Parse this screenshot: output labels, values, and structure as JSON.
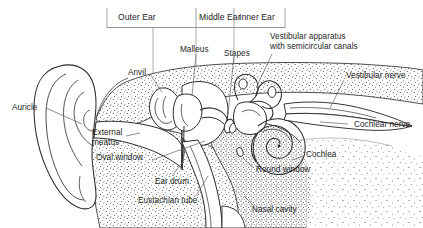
{
  "figure": {
    "type": "labelled-anatomical-diagram",
    "background_color": "#ffffff",
    "ink_color": "#1d1d1d",
    "leader_line_color": "#6e6e6e"
  },
  "sections": {
    "divider_label_outer": "Outer Ear",
    "divider_label_middle": "Middle Ear",
    "divider_label_inner": "Inner Ear"
  },
  "labels": {
    "auricle": "Auricle",
    "external_meatus": "External\nmeatus",
    "oval_window": "Oval window",
    "ear_drum": "Ear drum",
    "eustachian_tube": "Eustachian tube",
    "nasal_cavity": "Nasal cavity",
    "anvil": "Anvil",
    "malleus": "Malleus",
    "stapes": "Stapes",
    "vestibular_apparatus": "Vestibular apparatus\nwith semicircular canals",
    "vestibular_nerve": "Vestibular nerve",
    "cochlear_nerve": "Cochlear nerve",
    "cochlea": "Cochlea",
    "round_window": "Round window"
  }
}
